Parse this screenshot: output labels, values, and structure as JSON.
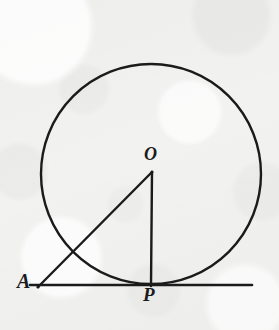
{
  "figure": {
    "kind": "geometry-diagram",
    "background_color": "#f2f2f1",
    "ink_color": "#1b1b1b",
    "labels": {
      "center": "O",
      "external_point": "A",
      "tangent_point": "P"
    },
    "geometry": {
      "circle": {
        "cx": 151,
        "cy": 174,
        "r": 110,
        "stroke_width": 2.4
      },
      "tangent_line": {
        "x1": 30,
        "y1": 285,
        "x2": 252,
        "y2": 285,
        "stroke_width": 2.6
      },
      "segment_AO": {
        "x1": 38,
        "y1": 287,
        "x2": 152,
        "y2": 172,
        "stroke_width": 2.4
      },
      "segment_OP": {
        "x1": 152,
        "y1": 172,
        "x2": 151,
        "y2": 286,
        "stroke_width": 2.4
      },
      "points": {
        "A": {
          "x": 38,
          "y": 287
        },
        "O": {
          "x": 152,
          "y": 172
        },
        "P": {
          "x": 151,
          "y": 285
        }
      }
    }
  }
}
